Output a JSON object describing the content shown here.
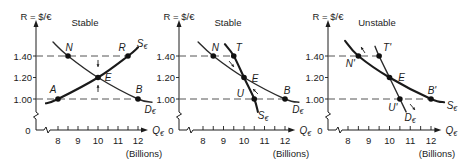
{
  "figure": {
    "panels": [
      {
        "title": "Stable"
      },
      {
        "title": "Stable"
      },
      {
        "title": "Unstable"
      }
    ]
  },
  "chart_data": [
    {
      "type": "line",
      "title": "Stable",
      "ylabel": "R = $/€",
      "xlabel": {
        "main": "Q",
        "sub": "€"
      },
      "x_unit": "(Billions)",
      "origin": "0",
      "x_ticks": [
        "8",
        "9",
        "10",
        "11",
        "12"
      ],
      "x_tick_values": [
        8,
        9,
        10,
        11,
        12
      ],
      "y_ticks": [
        "1.00",
        "1.20",
        "1.40"
      ],
      "y_tick_values": [
        1.0,
        1.2,
        1.4
      ],
      "xlim": [
        7.5,
        12.5
      ],
      "ylim": [
        1.0,
        1.4
      ],
      "axis_breaks": true,
      "series": [
        {
          "name": "D€",
          "label_main": "D",
          "label_sub": "€",
          "style": "thin",
          "points": [
            [
              7.75,
              1.53
            ],
            [
              8.5,
              1.4
            ],
            [
              10,
              1.2
            ],
            [
              12,
              1.0
            ],
            [
              12.7,
              0.97
            ]
          ],
          "label_at": [
            12.6,
            0.907
          ]
        },
        {
          "name": "S€",
          "label_main": "S",
          "label_sub": "€",
          "style": "thick",
          "points": [
            [
              7.4,
              0.96
            ],
            [
              8,
              1.0
            ],
            [
              10,
              1.2
            ],
            [
              11.5,
              1.4
            ],
            [
              12.0,
              1.48
            ]
          ],
          "label_at": [
            12.2,
            1.52
          ]
        }
      ],
      "marked_points": [
        {
          "label": "N",
          "x": 8.5,
          "y": 1.4,
          "dx": 1,
          "dy": -9
        },
        {
          "label": "R",
          "x": 11.5,
          "y": 1.4,
          "dx": -6,
          "dy": -9
        },
        {
          "label": "E",
          "x": 10,
          "y": 1.2,
          "dx": 10,
          "dy": 0
        },
        {
          "label": "A",
          "x": 8,
          "y": 1.0,
          "dx": -5,
          "dy": -10
        },
        {
          "label": "B",
          "x": 12,
          "y": 1.0,
          "dx": 1,
          "dy": -10
        }
      ],
      "dashed_lines": [
        {
          "y": 1.4,
          "to_x": 11.5
        },
        {
          "y": 1.0,
          "to_x": 12
        }
      ],
      "arrows": [
        {
          "from": [
            10,
            1.363
          ],
          "to": [
            10,
            1.298
          ],
          "meaning": "toward equilibrium"
        },
        {
          "from": [
            10,
            1.065
          ],
          "to": [
            10,
            1.13
          ],
          "meaning": "toward equilibrium"
        }
      ]
    },
    {
      "type": "line",
      "title": "Stable",
      "ylabel": "R = $/€",
      "xlabel": {
        "main": "Q",
        "sub": "€"
      },
      "x_unit": "(Billions)",
      "origin": "0",
      "x_ticks": [
        "8",
        "9",
        "10",
        "11",
        "12"
      ],
      "x_tick_values": [
        8,
        9,
        10,
        11,
        12
      ],
      "y_ticks": [
        "1.00",
        "1.20",
        "1.40"
      ],
      "y_tick_values": [
        1.0,
        1.2,
        1.4
      ],
      "xlim": [
        7.5,
        12.5
      ],
      "ylim": [
        1.0,
        1.4
      ],
      "axis_breaks": true,
      "series": [
        {
          "name": "D€",
          "label_main": "D",
          "label_sub": "€",
          "style": "thin",
          "points": [
            [
              7.76,
              1.53
            ],
            [
              8.5,
              1.4
            ],
            [
              10,
              1.2
            ],
            [
              12,
              1.0
            ],
            [
              12.68,
              0.97
            ]
          ],
          "label_at": [
            12.63,
            0.907
          ]
        },
        {
          "name": "S€",
          "label_main": "S",
          "label_sub": "€",
          "style": "thick",
          "points": [
            [
              9.07,
              1.51
            ],
            [
              9.5,
              1.4
            ],
            [
              10,
              1.2
            ],
            [
              10.5,
              1.0
            ],
            [
              10.68,
              0.88
            ]
          ],
          "label_at": [
            10.93,
            0.85
          ]
        }
      ],
      "marked_points": [
        {
          "label": "N",
          "x": 8.5,
          "y": 1.4,
          "dx": 2,
          "dy": -9
        },
        {
          "label": "T",
          "x": 9.5,
          "y": 1.4,
          "dx": 5,
          "dy": -9
        },
        {
          "label": "E",
          "x": 10,
          "y": 1.2,
          "dx": 11,
          "dy": 1
        },
        {
          "label": "U",
          "x": 10.5,
          "y": 1.0,
          "dx": -14,
          "dy": -6
        },
        {
          "label": "B",
          "x": 12,
          "y": 1.0,
          "dx": 2,
          "dy": -9
        }
      ],
      "dashed_lines": [
        {
          "y": 1.4,
          "to_x": 9.5
        },
        {
          "y": 1.0,
          "to_x": 12
        }
      ],
      "arrows": [
        {
          "from": [
            9.27,
            1.353
          ],
          "to": [
            9.51,
            1.298
          ],
          "meaning": "toward equilibrium"
        },
        {
          "from": [
            10.68,
            1.047
          ],
          "to": [
            10.44,
            1.093
          ],
          "meaning": "toward equilibrium"
        }
      ]
    },
    {
      "type": "line",
      "title": "Unstable",
      "ylabel": "R = $/€",
      "xlabel": {
        "main": "Q",
        "sub": "€"
      },
      "x_unit": "(Billions)",
      "origin": "0",
      "x_ticks": [
        "8",
        "9",
        "10",
        "11",
        "12"
      ],
      "x_tick_values": [
        8,
        9,
        10,
        11,
        12
      ],
      "y_ticks": [
        "1.00",
        "1.20",
        "1.40"
      ],
      "y_tick_values": [
        1.0,
        1.2,
        1.4
      ],
      "xlim": [
        7.5,
        12.5
      ],
      "ylim": [
        1.0,
        1.4
      ],
      "axis_breaks": true,
      "series": [
        {
          "name": "S€",
          "label_main": "S",
          "label_sub": "€",
          "style": "thick",
          "points": [
            [
              7.86,
              1.54
            ],
            [
              8.5,
              1.4
            ],
            [
              10,
              1.2
            ],
            [
              12,
              1.0
            ],
            [
              12.63,
              0.97
            ]
          ],
          "label_at": [
            13.01,
            0.944
          ]
        },
        {
          "name": "D€",
          "label_main": "D",
          "label_sub": "€",
          "style": "thin",
          "points": [
            [
              9.3,
              1.49
            ],
            [
              9.5,
              1.4
            ],
            [
              10,
              1.2
            ],
            [
              10.5,
              1.0
            ],
            [
              10.8,
              0.88
            ]
          ],
          "label_at": [
            10.99,
            0.83
          ]
        }
      ],
      "marked_points": [
        {
          "label": "N'",
          "x": 8.5,
          "y": 1.4,
          "dx": -8,
          "dy": 7
        },
        {
          "label": "T'",
          "x": 9.5,
          "y": 1.4,
          "dx": 8,
          "dy": -9
        },
        {
          "label": "E",
          "x": 10,
          "y": 1.2,
          "dx": 12,
          "dy": 0
        },
        {
          "label": "U'",
          "x": 10.5,
          "y": 1.0,
          "dx": -7,
          "dy": 8
        },
        {
          "label": "B'",
          "x": 12,
          "y": 1.0,
          "dx": 1,
          "dy": -9
        }
      ],
      "dashed_lines": [
        {
          "y": 1.4,
          "to_x": 9.5
        },
        {
          "y": 1.0,
          "to_x": 12
        }
      ],
      "arrows": [
        {
          "from": [
            8.82,
            1.428
          ],
          "to": [
            8.63,
            1.484
          ],
          "meaning": "away from equilibrium"
        },
        {
          "from": [
            10.99,
            0.953
          ],
          "to": [
            11.23,
            0.898
          ],
          "meaning": "away from equilibrium"
        }
      ]
    }
  ]
}
